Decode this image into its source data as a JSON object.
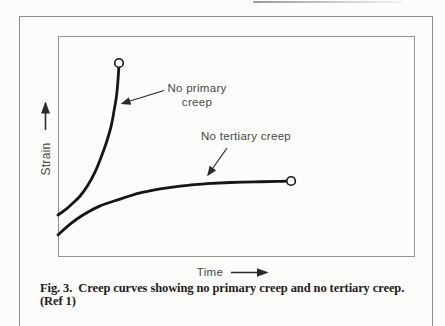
{
  "figure": {
    "caption": {
      "line1": "Fig. 3.  Creep curves showing no primary creep and no tertiary creep.",
      "line2": "(Ref 1)"
    },
    "axis_labels": {
      "y": "Strain",
      "x": "Time"
    },
    "annotations": {
      "no_primary_line1": "No primary",
      "no_primary_line2": "creep",
      "no_tertiary": "No tertiary creep"
    },
    "colors": {
      "curve": "#161616",
      "marker_fill": "#fcfcfb",
      "frame": "#8d8d8d",
      "label_text": "#474747",
      "caption_text": "#1c1c1c",
      "background": "#fcfcfb"
    }
  },
  "chart_data": {
    "type": "line",
    "title": "Creep curves showing no primary creep and no tertiary creep",
    "xlabel": "Time",
    "ylabel": "Strain",
    "grid": false,
    "tick_labels": "none (qualitative axes, arrows indicate increasing direction)",
    "x_range_normalized": [
      0,
      1
    ],
    "y_range_normalized": [
      0,
      1
    ],
    "series": [
      {
        "name": "No primary creep",
        "end_marker": "open-circle",
        "points": [
          [
            0.0,
            0.19
          ],
          [
            0.02,
            0.213
          ],
          [
            0.039,
            0.24
          ],
          [
            0.062,
            0.276
          ],
          [
            0.084,
            0.326
          ],
          [
            0.104,
            0.385
          ],
          [
            0.12,
            0.448
          ],
          [
            0.137,
            0.525
          ],
          [
            0.149,
            0.593
          ],
          [
            0.157,
            0.661
          ],
          [
            0.164,
            0.729
          ],
          [
            0.168,
            0.801
          ],
          [
            0.171,
            0.878
          ]
        ]
      },
      {
        "name": "No tertiary creep",
        "end_marker": "open-circle",
        "points": [
          [
            0.0,
            0.1
          ],
          [
            0.034,
            0.149
          ],
          [
            0.07,
            0.19
          ],
          [
            0.118,
            0.231
          ],
          [
            0.174,
            0.262
          ],
          [
            0.23,
            0.29
          ],
          [
            0.286,
            0.308
          ],
          [
            0.342,
            0.321
          ],
          [
            0.412,
            0.331
          ],
          [
            0.482,
            0.337
          ],
          [
            0.552,
            0.34
          ],
          [
            0.616,
            0.342
          ],
          [
            0.653,
            0.344
          ]
        ]
      }
    ]
  }
}
